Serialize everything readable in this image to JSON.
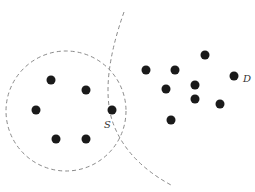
{
  "diagram": {
    "colors": {
      "dot": "#1a1a1a",
      "boundary": "#8a8a8a",
      "label": "#333333",
      "background": "#ffffff"
    },
    "neighborhood_circle": {
      "cx": 66,
      "cy": 111,
      "r": 60,
      "style": "dashed"
    },
    "separating_arc": {
      "path": "M124 12 Q100 80 112 120 Q125 160 171 185",
      "style": "dashed"
    },
    "left_cluster_points": [
      {
        "x": 51,
        "y": 80
      },
      {
        "x": 86,
        "y": 90
      },
      {
        "x": 36,
        "y": 110
      },
      {
        "x": 56,
        "y": 139
      },
      {
        "x": 86,
        "y": 139
      },
      {
        "x": 112,
        "y": 110
      }
    ],
    "right_cluster_points": [
      {
        "x": 205,
        "y": 55
      },
      {
        "x": 146,
        "y": 70
      },
      {
        "x": 175,
        "y": 70
      },
      {
        "x": 234,
        "y": 76
      },
      {
        "x": 195,
        "y": 85
      },
      {
        "x": 166,
        "y": 89
      },
      {
        "x": 195,
        "y": 99
      },
      {
        "x": 220,
        "y": 104
      },
      {
        "x": 171,
        "y": 120
      }
    ],
    "labels": [
      {
        "id": "S",
        "text": "S",
        "x": 104,
        "y": 128
      },
      {
        "id": "D",
        "text": "D",
        "x": 243,
        "y": 82
      }
    ]
  }
}
